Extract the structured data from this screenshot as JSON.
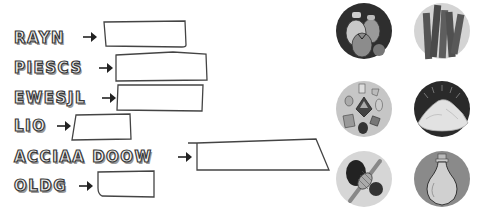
{
  "exercise": {
    "rows": [
      {
        "scrambled": "RAYN",
        "answer": ""
      },
      {
        "scrambled": "PIESCS",
        "answer": ""
      },
      {
        "scrambled": "EWESJL",
        "answer": ""
      },
      {
        "scrambled": "LIO",
        "answer": ""
      },
      {
        "scrambled": "ACCIAA DOOW",
        "answer": ""
      },
      {
        "scrambled": "OLDG",
        "answer": ""
      }
    ],
    "pictures": [
      {
        "icon": "money-bags-icon"
      },
      {
        "icon": "wood-sticks-icon"
      },
      {
        "icon": "jewels-icon"
      },
      {
        "icon": "spice-pile-icon"
      },
      {
        "icon": "yarn-spindle-icon"
      },
      {
        "icon": "oil-flask-icon"
      }
    ]
  },
  "colors": {
    "ink": "#3a3a3a",
    "circle_light": "#d9d9d9",
    "circle_dark": "#2e2e2e",
    "circle_mid": "#8a8a8a"
  }
}
